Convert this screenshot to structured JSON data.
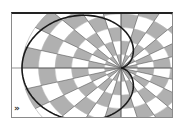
{
  "diagram": {
    "curve": {
      "type": "cardioid",
      "equation": "r = a(1 - cos θ)",
      "color": "#1a1a1a"
    },
    "grid": {
      "rings": 6,
      "sectors": 24,
      "fill_color": "#b0b0b0",
      "background_color": "#ffffff",
      "line_color": "#555555"
    },
    "frame": {
      "top_border_color": "#222222",
      "border_color": "#8a8a8a"
    }
  },
  "controls": {
    "expand_icon_glyph": "»"
  }
}
